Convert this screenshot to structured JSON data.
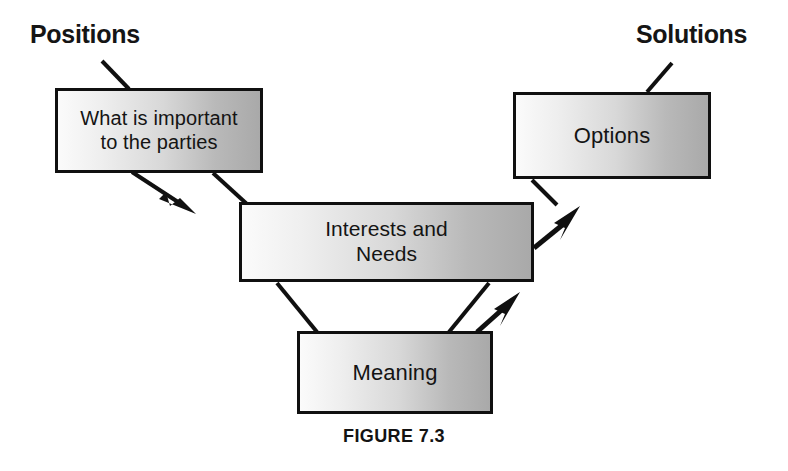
{
  "figure": {
    "caption": "FIGURE 7.3",
    "headings": {
      "left": "Positions",
      "right": "Solutions"
    },
    "boxes": [
      {
        "id": "positions",
        "label": "What is important\nto the parties"
      },
      {
        "id": "options",
        "label": "Options"
      },
      {
        "id": "interests",
        "label": "Interests and\nNeeds"
      },
      {
        "id": "meaning",
        "label": "Meaning"
      }
    ],
    "connectors": [
      {
        "name": "positions-to-interests-line",
        "type": "line",
        "from": "positions",
        "to": "interests"
      },
      {
        "name": "positions-to-interests-arrow",
        "type": "arrow",
        "from": "positions",
        "to": "interests"
      },
      {
        "name": "interests-to-options-line",
        "type": "line",
        "from": "options",
        "to": "interests"
      },
      {
        "name": "interests-to-options-arrow",
        "type": "arrow",
        "from": "interests",
        "to": "options"
      },
      {
        "name": "interests-to-meaning-line",
        "type": "line",
        "from": "interests",
        "to": "meaning"
      },
      {
        "name": "meaning-to-interests-line",
        "type": "line",
        "from": "meaning",
        "to": "interests"
      },
      {
        "name": "meaning-to-interests-arrow",
        "type": "arrow",
        "from": "meaning",
        "to": "interests"
      }
    ],
    "leaders": [
      {
        "name": "positions-leader-line",
        "label": "Positions"
      },
      {
        "name": "solutions-leader-line",
        "label": "Solutions"
      }
    ],
    "colors": {
      "stroke": "#101010",
      "box_fill_light": "#fbfbfb",
      "box_fill_dark": "#a9a9a9",
      "text": "#141414",
      "background": "#ffffff"
    }
  }
}
